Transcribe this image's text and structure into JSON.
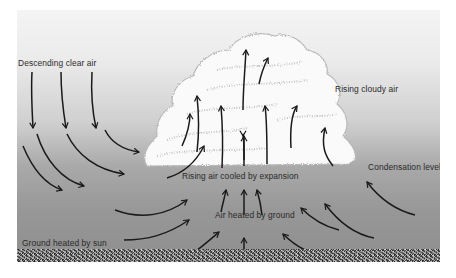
{
  "diagram": {
    "type": "convection-cloud-formation",
    "labels": {
      "descending": "Descending clear air",
      "rising_cloudy": "Rising cloudy air",
      "condensation": "Condensation level",
      "rising_cooled": "Rising air cooled by expansion",
      "air_heated": "Air heated by ground",
      "ground_heated": "Ground heated by sun"
    },
    "colors": {
      "sky_top": "#f4f4f4",
      "sky_bottom": "#8f8f8f",
      "cloud": "#fafafa",
      "arrow": "#1a1a1a",
      "text": "#2a2a2a"
    }
  }
}
